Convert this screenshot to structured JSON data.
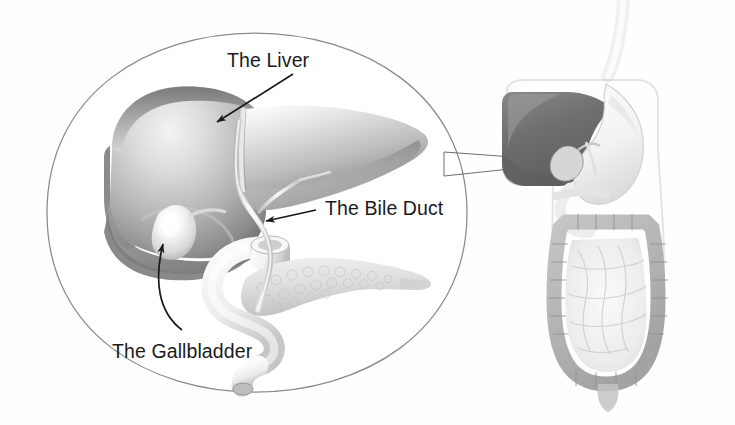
{
  "figure": {
    "kind": "medical-illustration",
    "style": "grayscale airbrush textbook art",
    "background_color": "#fefefe"
  },
  "labels": {
    "liver": "The Liver",
    "bile_duct": "The Bile Duct",
    "gallbladder": "The Gallbladder"
  },
  "ghost_text": {
    "top": "ghosted show-through text",
    "bottom": "ghosted show-through text"
  },
  "colors": {
    "label_text": "#1b1b1b",
    "arrow": "#1a1a1a",
    "magnifier_outline": "#8a8a8a",
    "leader_line": "#6f6f6f",
    "liver_dark": "#6e6e6e",
    "liver_mid": "#a8a8a8",
    "liver_light": "#e8e8e8",
    "gallbladder_light": "#fbfbfb",
    "duodenum": "#f2f2f2",
    "pancreas": "#e2e2e2",
    "body_liver_dark": "#757575",
    "body_organ_mid": "#b9b9b9",
    "body_organ_pale": "#efefef"
  },
  "magnified_inset": {
    "shape": "rounded-oval outline",
    "organs": [
      "liver",
      "gallbladder",
      "bile duct",
      "duodenum",
      "pancreas"
    ]
  },
  "body_diagram": {
    "organs": [
      "esophagus",
      "stomach",
      "liver",
      "gallbladder",
      "large intestine",
      "small intestine",
      "rectum"
    ],
    "pointer_lines": 2
  }
}
